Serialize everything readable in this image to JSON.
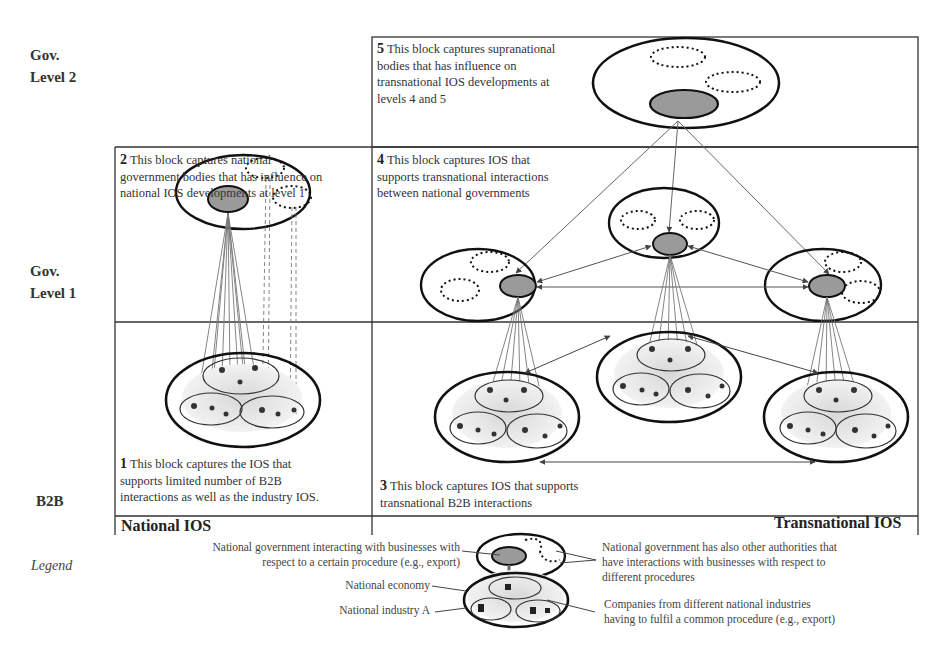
{
  "row_labels": {
    "gov_level_2": [
      "Gov.",
      "Level 2"
    ],
    "gov_level_1": [
      "Gov.",
      "Level 1"
    ],
    "b2b": "B2B",
    "legend": "Legend"
  },
  "blocks": [
    {
      "number": "1",
      "text": "This block captures the IOS that supports limited number of B2B interactions as well as the industry IOS.",
      "lines": [
        "This block captures the IOS that",
        "supports limited number of B2B",
        "interactions as well as the industry IOS."
      ]
    },
    {
      "number": "2",
      "text": "This block captures national government bodies that has influence on national IOS developments at level 1",
      "lines": [
        "This block captures national",
        "government bodies that has influence on",
        "national IOS developments at level 1"
      ]
    },
    {
      "number": "3",
      "text": "This block captures IOS that supports transnational B2B interactions",
      "lines": [
        "This block captures IOS that supports",
        "transnational B2B interactions"
      ]
    },
    {
      "number": "4",
      "text": "This block captures IOS that supports transnational interactions between national governments",
      "lines": [
        "This block captures IOS that",
        "supports transnational interactions",
        "between national governments"
      ]
    },
    {
      "number": "5",
      "text": "This block captures supranational bodies that has influence on transnational IOS developments at levels 4 and 5",
      "lines": [
        "This block captures supranational",
        "bodies that has influence on",
        "transnational IOS developments at",
        "levels 4 and 5"
      ]
    }
  ],
  "footer": {
    "national": "National IOS",
    "transnational": "Transnational IOS"
  },
  "legend": {
    "gov_interacting": [
      "National government interacting with businesses with",
      "respect to a certain procedure (e.g., export)"
    ],
    "economy": "National economy",
    "industry": "National industry A",
    "other_authorities": [
      "National government has also other authorities that",
      "have interactions with businesses with respect to",
      "different procedures"
    ],
    "companies": [
      "Companies from different national industries",
      "having to fulfil a common procedure (e.g., export)"
    ]
  },
  "colors": {
    "line": "#222222",
    "gray_node": "#9a9a9a",
    "shade": "#e6e6e6",
    "arrow": "#666666"
  }
}
